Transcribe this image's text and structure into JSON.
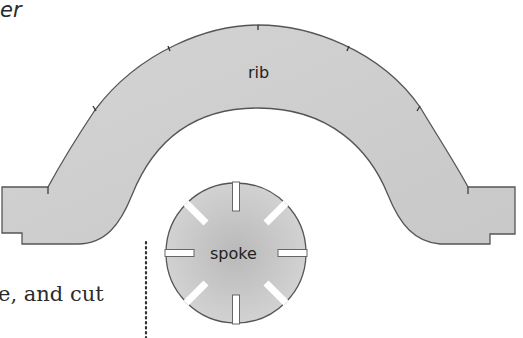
{
  "page": {
    "top_fragment": "er",
    "body_fragment": "e, and cut"
  },
  "figure": {
    "parts": [
      {
        "id": "rib",
        "label": "rib",
        "tick_marks": 5
      },
      {
        "id": "spoke",
        "label": "spoke",
        "slots": 8
      }
    ],
    "fill_color": "#cfcfcf",
    "outline_color": "#555555",
    "cut_line": "dotted vertical line"
  }
}
